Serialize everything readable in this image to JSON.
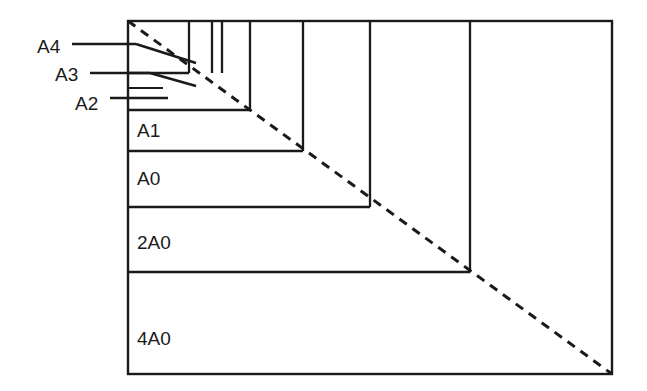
{
  "figure": {
    "colors": {
      "ink": "#1a1a1a",
      "background": "#ffffff"
    },
    "outer_frame": {
      "left": 128,
      "top": 21,
      "right": 612,
      "bottom": 374
    },
    "diagonal": {
      "style": "dashed",
      "from_x": 128,
      "from_y": 21,
      "to_x": 612,
      "to_y": 374
    },
    "inner_labels": [
      {
        "name": "A1",
        "text": "A1",
        "x": 137,
        "y": 137
      },
      {
        "name": "A0",
        "text": "A0",
        "x": 137,
        "y": 185
      },
      {
        "name": "2A0",
        "text": "2A0",
        "x": 137,
        "y": 249
      },
      {
        "name": "4A0",
        "text": "4A0",
        "x": 137,
        "y": 345
      }
    ],
    "callout_labels": [
      {
        "name": "A4",
        "text": "A4",
        "x": 37,
        "y": 53
      },
      {
        "name": "A3",
        "text": "A3",
        "x": 55,
        "y": 81
      },
      {
        "name": "A2",
        "text": "A2",
        "x": 75,
        "y": 110
      }
    ],
    "callout_leaders": [
      {
        "name": "a4-leader",
        "segments": [
          {
            "x1": 72,
            "y1": 44,
            "x2": 136,
            "y2": 44
          },
          {
            "x1": 136,
            "y1": 44,
            "x2": 196,
            "y2": 63
          }
        ]
      },
      {
        "name": "a3-leader",
        "segments": [
          {
            "x1": 90,
            "y1": 73,
            "x2": 150,
            "y2": 73
          },
          {
            "x1": 150,
            "y1": 73,
            "x2": 196,
            "y2": 86
          }
        ]
      },
      {
        "name": "a2-leader",
        "segments": [
          {
            "x1": 110,
            "y1": 98,
            "x2": 168,
            "y2": 98
          }
        ]
      }
    ],
    "vertical_dividers": [
      {
        "name": "divider-a4",
        "x": 189,
        "y1": 21,
        "y2": 73
      },
      {
        "name": "divider-a5",
        "x": 212,
        "y1": 21,
        "y2": 73
      },
      {
        "name": "divider-a6",
        "x": 222,
        "y1": 21,
        "y2": 73
      },
      {
        "name": "divider-a3",
        "x": 250,
        "y1": 21,
        "y2": 110
      },
      {
        "name": "divider-a2",
        "x": 303,
        "y1": 21,
        "y2": 151
      },
      {
        "name": "divider-a1",
        "x": 370,
        "y1": 21,
        "y2": 207
      },
      {
        "name": "divider-a0",
        "x": 470,
        "y1": 21,
        "y2": 272
      }
    ],
    "horizontal_dividers": [
      {
        "name": "divider-top-small",
        "y": 73,
        "x1": 128,
        "x2": 189
      },
      {
        "name": "divider-a3-row",
        "y": 110,
        "x1": 128,
        "x2": 250
      },
      {
        "name": "divider-a1-row",
        "y": 151,
        "x1": 128,
        "x2": 303
      },
      {
        "name": "divider-a0-row",
        "y": 207,
        "x1": 128,
        "x2": 370
      },
      {
        "name": "divider-2a0-row",
        "y": 272,
        "x1": 128,
        "x2": 470
      }
    ],
    "thin_markers": [
      {
        "name": "a2-tick",
        "y": 88,
        "x1": 128,
        "x2": 163
      }
    ]
  },
  "chart_data": {
    "type": "diagram",
    "series_labels": [
      "A4",
      "A3",
      "A2",
      "A1",
      "A0",
      "2A0",
      "4A0"
    ]
  }
}
